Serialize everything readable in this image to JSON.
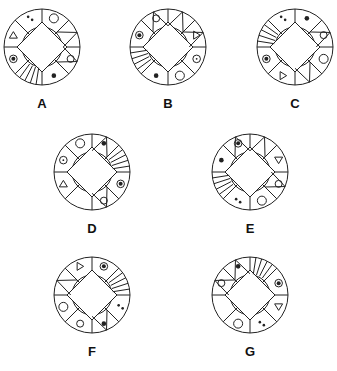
{
  "puzzle": {
    "stroke_color": "#222222",
    "figures": [
      {
        "label": "A",
        "cx": 42,
        "cy": 47,
        "label_y": 96,
        "star_sectors": [
          1,
          2
        ],
        "hatch_sector": 4,
        "symbols": [
          {
            "type": "two-dots",
            "sector": 7
          },
          {
            "type": "circle",
            "sector": 0
          },
          {
            "type": "triangle-up",
            "sector": 6
          },
          {
            "type": "bullseye",
            "sector": 5
          },
          {
            "type": "small-circle",
            "sector": 2
          },
          {
            "type": "dot",
            "sector": 3
          }
        ]
      },
      {
        "label": "B",
        "cx": 168,
        "cy": 47,
        "label_y": 96,
        "star_sectors": [
          0,
          7,
          1
        ],
        "hatch_sector": 5,
        "symbols": [
          {
            "type": "small-circle",
            "sector": 7
          },
          {
            "type": "bullseye",
            "sector": 6
          },
          {
            "type": "triangle-right",
            "sector": 1
          },
          {
            "type": "dotted-circle",
            "sector": 2
          },
          {
            "type": "circle",
            "sector": 3
          },
          {
            "type": "dot",
            "sector": 4
          }
        ]
      },
      {
        "label": "C",
        "cx": 295,
        "cy": 47,
        "label_y": 96,
        "star_sectors": [
          1,
          3
        ],
        "hatch_sector": 6,
        "symbols": [
          {
            "type": "two-dots",
            "sector": 7
          },
          {
            "type": "dot",
            "sector": 0
          },
          {
            "type": "small-circle",
            "sector": 1
          },
          {
            "type": "circle",
            "sector": 2
          },
          {
            "type": "bullseye",
            "sector": 5
          },
          {
            "type": "triangle-right",
            "sector": 4
          }
        ]
      },
      {
        "label": "D",
        "cx": 92,
        "cy": 172,
        "label_y": 221,
        "star_sectors": [
          0,
          3
        ],
        "hatch_sector": 1,
        "symbols": [
          {
            "type": "circle",
            "sector": 7
          },
          {
            "type": "dot",
            "sector": 0
          },
          {
            "type": "dotted-circle",
            "sector": 6
          },
          {
            "type": "triangle-up",
            "sector": 5
          },
          {
            "type": "bullseye",
            "sector": 2
          },
          {
            "type": "small-circle",
            "sector": 3
          }
        ]
      },
      {
        "label": "E",
        "cx": 250,
        "cy": 172,
        "label_y": 221,
        "star_sectors": [
          0,
          7,
          2
        ],
        "hatch_sector": 5,
        "symbols": [
          {
            "type": "bullseye",
            "sector": 7
          },
          {
            "type": "dot",
            "sector": 6
          },
          {
            "type": "triangle-down",
            "sector": 1
          },
          {
            "type": "small-circle",
            "sector": 2
          },
          {
            "type": "circle",
            "sector": 3
          },
          {
            "type": "two-dots",
            "sector": 4
          }
        ]
      },
      {
        "label": "F",
        "cx": 92,
        "cy": 295,
        "label_y": 344,
        "star_sectors": [
          6,
          3
        ],
        "hatch_sector": 1,
        "symbols": [
          {
            "type": "triangle-right",
            "sector": 7
          },
          {
            "type": "bullseye",
            "sector": 0
          },
          {
            "type": "two-dots",
            "sector": 2
          },
          {
            "type": "circle",
            "sector": 5
          },
          {
            "type": "small-circle",
            "sector": 4
          },
          {
            "type": "dot",
            "sector": 3
          }
        ]
      },
      {
        "label": "G",
        "cx": 250,
        "cy": 295,
        "label_y": 344,
        "star_sectors": [
          6,
          7
        ],
        "hatch_sector": 0,
        "symbols": [
          {
            "type": "dot",
            "sector": 7
          },
          {
            "type": "small-circle",
            "sector": 6
          },
          {
            "type": "bullseye",
            "sector": 1
          },
          {
            "type": "triangle-down",
            "sector": 2
          },
          {
            "type": "two-dots",
            "sector": 3
          },
          {
            "type": "circle",
            "sector": 4
          }
        ]
      }
    ]
  }
}
